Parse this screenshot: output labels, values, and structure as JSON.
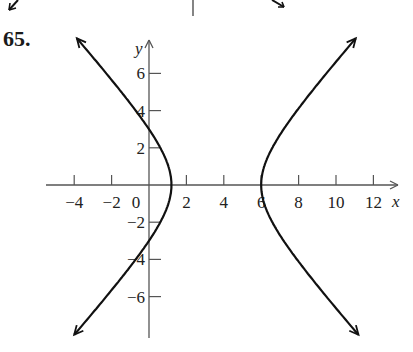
{
  "problem_number": "65.",
  "chart_data": {
    "type": "line",
    "title": "",
    "xlabel": "x",
    "ylabel": "y",
    "xlim": [
      -5,
      13.5
    ],
    "ylim": [
      -8.2,
      8
    ],
    "grid": false,
    "x_ticks": [
      -4,
      -2,
      0,
      2,
      4,
      6,
      8,
      10,
      12
    ],
    "x_tick_labels": [
      "−4",
      "−2",
      "0",
      "2",
      "4",
      "6",
      "8",
      "10",
      "12"
    ],
    "y_ticks": [
      -6,
      -4,
      -2,
      2,
      4,
      6
    ],
    "y_tick_labels": [
      "−6",
      "−4",
      "−2",
      "2",
      "4",
      "6"
    ],
    "curve": {
      "kind": "hyperbola",
      "center": [
        3.6,
        0
      ],
      "a": 2.4,
      "b": 2.68,
      "vertices": [
        [
          1.2,
          0
        ],
        [
          6.0,
          0
        ]
      ],
      "y_intercepts": [
        3,
        -3
      ],
      "branches": [
        {
          "name": "left",
          "points": [
            [
              -3.9,
              7.6
            ],
            [
              -1.5,
              4.8
            ],
            [
              0,
              3.0
            ],
            [
              1.2,
              0
            ],
            [
              0,
              -3.0
            ],
            [
              -1.5,
              -4.8
            ],
            [
              -4.1,
              -8.0
            ]
          ]
        },
        {
          "name": "right",
          "points": [
            [
              11.1,
              7.6
            ],
            [
              8.7,
              4.8
            ],
            [
              7.2,
              3.0
            ],
            [
              6.0,
              0
            ],
            [
              7.2,
              -3.0
            ],
            [
              8.7,
              -4.8
            ],
            [
              11.1,
              -8.0
            ]
          ]
        }
      ],
      "arrows_at_ends": true
    }
  },
  "decor": {
    "axis_color": "#555555",
    "curve_color": "#111111"
  }
}
